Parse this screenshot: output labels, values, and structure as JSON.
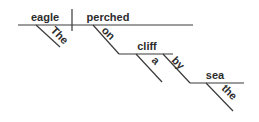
{
  "diagram": {
    "type": "sentence-diagram",
    "words": {
      "subject": "eagle",
      "verb": "perched",
      "subject_modifier": "The",
      "preposition_1": "on",
      "object_1": "cliff",
      "object_1_modifier": "a",
      "preposition_2": "by",
      "object_2": "sea",
      "object_2_modifier": "the"
    },
    "line_color": "#3a3a3a",
    "text_color": "#2d2d2d"
  }
}
